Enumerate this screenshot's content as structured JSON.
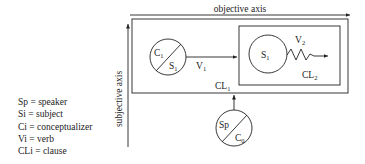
{
  "diagram": {
    "axes": {
      "horizontal_label": "objective axis",
      "vertical_label": "subjective axis"
    },
    "circles": [
      {
        "id": "c1",
        "top": "C",
        "top_sub": "1",
        "bottom": "S",
        "bottom_sub": "1"
      },
      {
        "id": "s1",
        "label": "S",
        "label_sub": "1"
      },
      {
        "id": "sp",
        "top": "Sp",
        "bottom": "C",
        "bottom_sub": "0"
      }
    ],
    "arrows": [
      {
        "label": "V",
        "label_sub": "1"
      },
      {
        "label": "V",
        "label_sub": "2"
      }
    ],
    "boxes": [
      {
        "label": "CL",
        "label_sub": "1"
      },
      {
        "label": "CL",
        "label_sub": "2"
      }
    ],
    "legend": [
      "Sp = speaker",
      "Si = subject",
      "Ci = conceptualizer",
      "Vi = verb",
      "CLi = clause"
    ]
  }
}
